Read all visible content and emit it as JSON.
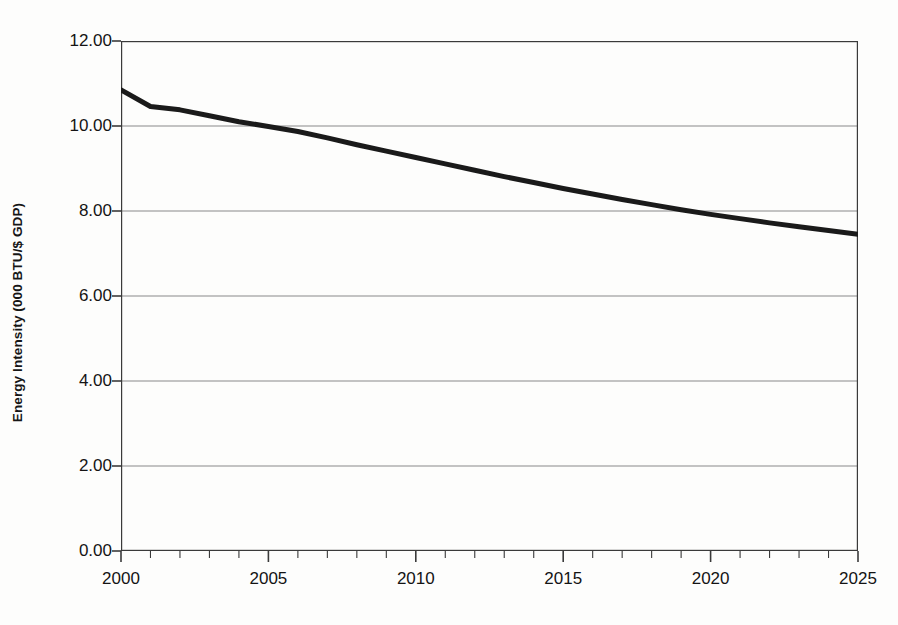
{
  "chart_data": {
    "type": "line",
    "title": "",
    "xlabel": "",
    "ylabel": "Energy Intensity (000 BTU/$ GDP)",
    "xlim": [
      2000,
      2025
    ],
    "ylim": [
      0.0,
      12.0
    ],
    "grid": true,
    "legend": "none",
    "x_tick_labels": [
      "2000",
      "2005",
      "2010",
      "2015",
      "2020",
      "2025"
    ],
    "x_tick_values": [
      2000,
      2005,
      2010,
      2015,
      2020,
      2025
    ],
    "x_minor_tick_step": 1,
    "y_tick_labels": [
      "0.00",
      "2.00",
      "4.00",
      "6.00",
      "8.00",
      "10.00",
      "12.00"
    ],
    "y_tick_values": [
      0,
      2,
      4,
      6,
      8,
      10,
      12
    ],
    "series": [
      {
        "name": "Energy Intensity",
        "color": "#1a1a1a",
        "line_width": 5,
        "x": [
          2000,
          2001,
          2002,
          2003,
          2004,
          2005,
          2006,
          2007,
          2008,
          2009,
          2010,
          2011,
          2012,
          2013,
          2014,
          2015,
          2016,
          2017,
          2018,
          2019,
          2020,
          2021,
          2022,
          2023,
          2024,
          2025
        ],
        "values": [
          10.85,
          10.46,
          10.38,
          10.24,
          10.1,
          9.99,
          9.87,
          9.72,
          9.56,
          9.41,
          9.26,
          9.11,
          8.96,
          8.81,
          8.67,
          8.53,
          8.4,
          8.27,
          8.15,
          8.03,
          7.92,
          7.82,
          7.72,
          7.63,
          7.54,
          7.45
        ]
      }
    ]
  },
  "axes": {
    "y_title": "Energy Intensity (000 BTU/$ GDP)"
  },
  "style": {
    "line_color": "#1a1a1a",
    "grid_color": "#8a8a8a",
    "axis_color": "#3a3a3a",
    "background": "#fdfdfc",
    "text_color": "#141414"
  }
}
